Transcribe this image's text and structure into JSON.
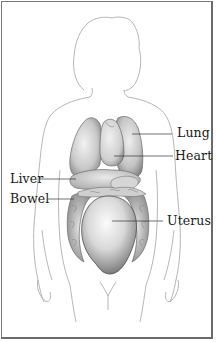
{
  "diagram": {
    "labels": [
      {
        "id": "lung",
        "text": "Lung"
      },
      {
        "id": "heart",
        "text": "Heart"
      },
      {
        "id": "liver",
        "text": "Liver"
      },
      {
        "id": "bowel",
        "text": "Bowel"
      },
      {
        "id": "uterus",
        "text": "Uterus"
      }
    ],
    "colors": {
      "border": "#7a7a7a",
      "outline": "#9a9a9a",
      "organ_shade": "#6e6e6e",
      "label_text": "#1a1a1a",
      "leader_line": "#333333"
    }
  }
}
